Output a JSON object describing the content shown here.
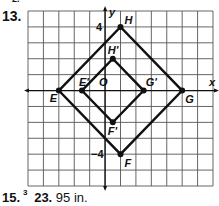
{
  "header_fragment": "2.",
  "problem": {
    "number": "13."
  },
  "graph": {
    "grid": {
      "cols": 12,
      "rows": 11,
      "x_min": -5,
      "x_max": 7,
      "y_max": 5,
      "y_min": -6
    },
    "axis_labels": {
      "x": "x",
      "y": "y"
    },
    "tick_labels": [
      {
        "text": "4",
        "at": [
          0,
          4
        ]
      },
      {
        "text": "−4",
        "at": [
          0,
          -4
        ]
      }
    ],
    "origin_label": "O",
    "outer_polygon": {
      "name": "EHGF",
      "points": [
        {
          "label": "E",
          "x": -3,
          "y": 0
        },
        {
          "label": "H",
          "x": 1,
          "y": 4
        },
        {
          "label": "G",
          "x": 5,
          "y": 0
        },
        {
          "label": "F",
          "x": 1,
          "y": -4
        }
      ]
    },
    "inner_polygon": {
      "name": "E'H'G'F'",
      "points": [
        {
          "label": "E'",
          "x": -1.5,
          "y": 0
        },
        {
          "label": "H'",
          "x": 0.5,
          "y": 2
        },
        {
          "label": "G'",
          "x": 2.5,
          "y": 0
        },
        {
          "label": "F'",
          "x": 0.5,
          "y": -2
        }
      ]
    }
  },
  "footer": {
    "item1_number": "15.",
    "item1_fraction_numerator": "3",
    "item2_number": "23.",
    "item2_answer": "95 in."
  }
}
